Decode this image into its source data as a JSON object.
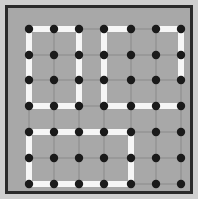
{
  "figure": {
    "width": 198,
    "height": 199,
    "background_color": "#cfcfcf",
    "frame_color": "#2b2b2b",
    "panel_color": "#a8a8a8",
    "dot_color": "#1a1a1a",
    "wall_color": "#f6f6f6",
    "gridline_color": "#8a8a8a"
  },
  "chart_data": {
    "type": "scatter",
    "title": "",
    "subtitle": "",
    "xlabel": "",
    "ylabel": "",
    "legend": [],
    "grid": true,
    "legend_position": "none",
    "columns": 7,
    "rows": 7,
    "xlim": [
      0,
      6
    ],
    "ylim": [
      0,
      6
    ],
    "xticks": [
      0,
      1,
      2,
      3,
      4,
      5,
      6
    ],
    "yticks": [
      0,
      1,
      2,
      3,
      4,
      5,
      6
    ],
    "x_pixels": [
      21,
      46,
      71,
      96,
      123,
      148,
      173
    ],
    "y_pixels": [
      21,
      47,
      72,
      98,
      124,
      150,
      176
    ],
    "node_count": 49,
    "nodes": [
      {
        "col": 0,
        "row": 0
      },
      {
        "col": 1,
        "row": 0
      },
      {
        "col": 2,
        "row": 0
      },
      {
        "col": 3,
        "row": 0
      },
      {
        "col": 4,
        "row": 0
      },
      {
        "col": 5,
        "row": 0
      },
      {
        "col": 6,
        "row": 0
      },
      {
        "col": 0,
        "row": 1
      },
      {
        "col": 1,
        "row": 1
      },
      {
        "col": 2,
        "row": 1
      },
      {
        "col": 3,
        "row": 1
      },
      {
        "col": 4,
        "row": 1
      },
      {
        "col": 5,
        "row": 1
      },
      {
        "col": 6,
        "row": 1
      },
      {
        "col": 0,
        "row": 2
      },
      {
        "col": 1,
        "row": 2
      },
      {
        "col": 2,
        "row": 2
      },
      {
        "col": 3,
        "row": 2
      },
      {
        "col": 4,
        "row": 2
      },
      {
        "col": 5,
        "row": 2
      },
      {
        "col": 6,
        "row": 2
      },
      {
        "col": 0,
        "row": 3
      },
      {
        "col": 1,
        "row": 3
      },
      {
        "col": 2,
        "row": 3
      },
      {
        "col": 3,
        "row": 3
      },
      {
        "col": 4,
        "row": 3
      },
      {
        "col": 5,
        "row": 3
      },
      {
        "col": 6,
        "row": 3
      },
      {
        "col": 0,
        "row": 4
      },
      {
        "col": 1,
        "row": 4
      },
      {
        "col": 2,
        "row": 4
      },
      {
        "col": 3,
        "row": 4
      },
      {
        "col": 4,
        "row": 4
      },
      {
        "col": 5,
        "row": 4
      },
      {
        "col": 6,
        "row": 4
      },
      {
        "col": 0,
        "row": 5
      },
      {
        "col": 1,
        "row": 5
      },
      {
        "col": 2,
        "row": 5
      },
      {
        "col": 3,
        "row": 5
      },
      {
        "col": 4,
        "row": 5
      },
      {
        "col": 5,
        "row": 5
      },
      {
        "col": 6,
        "row": 5
      },
      {
        "col": 0,
        "row": 6
      },
      {
        "col": 1,
        "row": 6
      },
      {
        "col": 2,
        "row": 6
      },
      {
        "col": 3,
        "row": 6
      },
      {
        "col": 4,
        "row": 6
      },
      {
        "col": 5,
        "row": 6
      },
      {
        "col": 6,
        "row": 6
      }
    ],
    "walls_horizontal": [
      {
        "row": 0,
        "from_col": 0,
        "to_col": 2
      },
      {
        "row": 0,
        "from_col": 3,
        "to_col": 4
      },
      {
        "row": 0,
        "from_col": 5,
        "to_col": 6
      },
      {
        "row": 3,
        "from_col": 0,
        "to_col": 2
      },
      {
        "row": 3,
        "from_col": 3,
        "to_col": 6
      },
      {
        "row": 4,
        "from_col": 0,
        "to_col": 4
      },
      {
        "row": 6,
        "from_col": 0,
        "to_col": 4
      }
    ],
    "walls_vertical": [
      {
        "col": 0,
        "from_row": 0,
        "to_row": 3
      },
      {
        "col": 2,
        "from_row": 0,
        "to_row": 3
      },
      {
        "col": 3,
        "from_row": 0,
        "to_row": 3
      },
      {
        "col": 6,
        "from_row": 0,
        "to_row": 2
      },
      {
        "col": 0,
        "from_row": 4,
        "to_row": 6
      },
      {
        "col": 4,
        "from_row": 4,
        "to_row": 6
      }
    ],
    "wall_segment_count": 13
  }
}
